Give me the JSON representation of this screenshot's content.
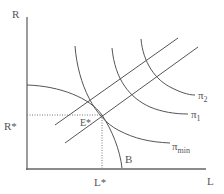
{
  "diagram": {
    "axes": {
      "y_label": "R",
      "x_label": "L"
    },
    "equilibrium": {
      "point_label": "E*",
      "x_value_label": "L*",
      "y_value_label": "R*"
    },
    "curves": {
      "budget_label": "B",
      "isoprofit_min_label": "π",
      "isoprofit_min_sub": "min",
      "isoprofit_1_label": "π",
      "isoprofit_1_sub": "1",
      "isoprofit_2_label": "π",
      "isoprofit_2_sub": "2"
    },
    "colors": {
      "line": "#555555",
      "axis": "#666666",
      "background": "#ffffff"
    }
  }
}
